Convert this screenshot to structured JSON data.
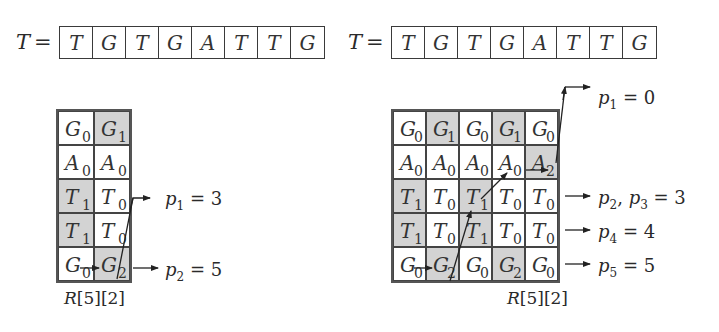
{
  "left": {
    "text_label": "T",
    "equals": "=",
    "text_array": [
      "T",
      "G",
      "T",
      "G",
      "A",
      "T",
      "T",
      "G"
    ],
    "grid": {
      "rows": [
        [
          {
            "ch": "G",
            "sub": "0",
            "shaded": false
          },
          {
            "ch": "G",
            "sub": "1",
            "shaded": true
          }
        ],
        [
          {
            "ch": "A",
            "sub": "0",
            "shaded": false
          },
          {
            "ch": "A",
            "sub": "0",
            "shaded": false
          }
        ],
        [
          {
            "ch": "T",
            "sub": "1",
            "shaded": true
          },
          {
            "ch": "T",
            "sub": "0",
            "shaded": false
          }
        ],
        [
          {
            "ch": "T",
            "sub": "1",
            "shaded": true
          },
          {
            "ch": "T",
            "sub": "0",
            "shaded": false
          }
        ],
        [
          {
            "ch": "G",
            "sub": "0",
            "shaded": false
          },
          {
            "ch": "G",
            "sub": "2",
            "shaded": true
          }
        ]
      ]
    },
    "caption": {
      "name": "R",
      "index": "[5][2]"
    },
    "outputs": [
      {
        "var": "p",
        "sub": "1",
        "rest": " = 3"
      },
      {
        "var": "p",
        "sub": "2",
        "rest": " = 5"
      }
    ]
  },
  "right": {
    "text_label": "T",
    "equals": "=",
    "text_array": [
      "T",
      "G",
      "T",
      "G",
      "A",
      "T",
      "T",
      "G"
    ],
    "grid": {
      "rows": [
        [
          {
            "ch": "G",
            "sub": "0",
            "shaded": false
          },
          {
            "ch": "G",
            "sub": "1",
            "shaded": true
          },
          {
            "ch": "G",
            "sub": "0",
            "shaded": false
          },
          {
            "ch": "G",
            "sub": "1",
            "shaded": true
          },
          {
            "ch": "G",
            "sub": "0",
            "shaded": false
          }
        ],
        [
          {
            "ch": "A",
            "sub": "0",
            "shaded": false
          },
          {
            "ch": "A",
            "sub": "0",
            "shaded": false
          },
          {
            "ch": "A",
            "sub": "0",
            "shaded": false
          },
          {
            "ch": "A",
            "sub": "0",
            "shaded": false
          },
          {
            "ch": "A",
            "sub": "2",
            "shaded": true
          }
        ],
        [
          {
            "ch": "T",
            "sub": "1",
            "shaded": true
          },
          {
            "ch": "T",
            "sub": "0",
            "shaded": false
          },
          {
            "ch": "T",
            "sub": "1",
            "shaded": true
          },
          {
            "ch": "T",
            "sub": "0",
            "shaded": false
          },
          {
            "ch": "T",
            "sub": "0",
            "shaded": false
          }
        ],
        [
          {
            "ch": "T",
            "sub": "1",
            "shaded": true
          },
          {
            "ch": "T",
            "sub": "0",
            "shaded": false
          },
          {
            "ch": "T",
            "sub": "1",
            "shaded": true
          },
          {
            "ch": "T",
            "sub": "0",
            "shaded": false
          },
          {
            "ch": "T",
            "sub": "0",
            "shaded": false
          }
        ],
        [
          {
            "ch": "G",
            "sub": "0",
            "shaded": false
          },
          {
            "ch": "G",
            "sub": "2",
            "shaded": true
          },
          {
            "ch": "G",
            "sub": "0",
            "shaded": false
          },
          {
            "ch": "G",
            "sub": "2",
            "shaded": true
          },
          {
            "ch": "G",
            "sub": "0",
            "shaded": false
          }
        ]
      ]
    },
    "caption": {
      "name": "R",
      "index": "[5][2]"
    },
    "outputs": [
      {
        "var": "p",
        "sub": "1",
        "rest": " = 0"
      },
      {
        "var": "p",
        "sub": "2",
        "mid": ", ",
        "var2": "p",
        "sub2": "3",
        "rest": " = 3"
      },
      {
        "var": "p",
        "sub": "4",
        "rest": " = 4"
      },
      {
        "var": "p",
        "sub": "5",
        "rest": " = 5"
      }
    ]
  },
  "colors": {
    "shaded_cell": "#d3d3d3",
    "line": "#333333",
    "background": "#ffffff"
  }
}
